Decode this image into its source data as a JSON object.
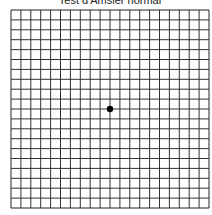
{
  "title": "Test d'Amsler normal",
  "grid": {
    "x0": 11,
    "y0": 10,
    "cell": 9.9,
    "cols": 20,
    "rows": 20,
    "line_color": "#333333",
    "border_color": "#222222"
  },
  "fixation_dot": {
    "cx": 110,
    "cy": 109,
    "r": 3.2,
    "color": "#000000"
  }
}
